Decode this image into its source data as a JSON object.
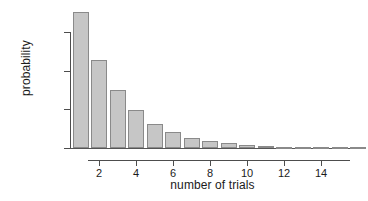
{
  "chart_data": {
    "type": "bar",
    "title": "",
    "xlabel": "number of trials",
    "ylabel": "probability",
    "categories": [
      1,
      2,
      3,
      4,
      5,
      6,
      7,
      8,
      9,
      10,
      11,
      12,
      13,
      14,
      15,
      16
    ],
    "values": [
      0.352,
      0.228,
      0.149,
      0.097,
      0.063,
      0.041,
      0.027,
      0.017,
      0.012,
      0.008,
      0.005,
      0.003,
      0.002,
      0.0013,
      0.0009,
      0.0006
    ],
    "xlim": [
      0.3,
      16.5
    ],
    "ylim": [
      0.0,
      0.36
    ],
    "xticks": [
      2,
      4,
      6,
      8,
      10,
      12,
      14
    ],
    "xticklabels": [
      "2",
      "4",
      "6",
      "8",
      "10",
      "12",
      "14"
    ],
    "yticks": [
      0.0,
      0.1,
      0.2,
      0.3
    ],
    "yticklabels": [
      "0.0",
      "0.1",
      "0.2",
      "0.3"
    ],
    "grid": false,
    "legend": null,
    "bar_fill_color": "#c6c6c6",
    "bar_edge_color": "#8a8a8a",
    "axis_color": "#4d4d4d",
    "background_color": "#ffffff"
  }
}
